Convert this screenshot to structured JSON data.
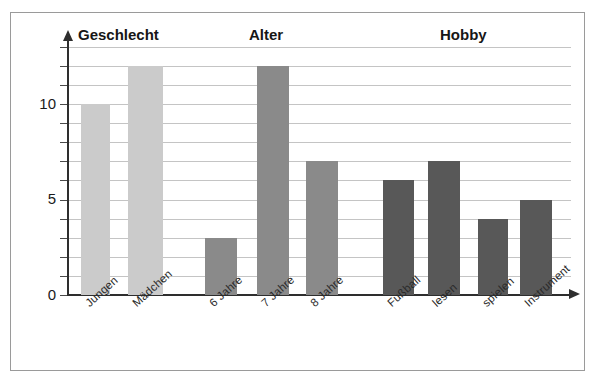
{
  "chart_data": {
    "type": "bar",
    "title": "",
    "xlabel": "",
    "ylabel": "",
    "ylim": [
      0,
      13
    ],
    "grid": true,
    "legend_position": "none",
    "y_ticks_labeled": [
      "0",
      "5",
      "10"
    ],
    "y_tick_values": [
      0,
      5,
      10
    ],
    "y_minor_ticks": [
      1,
      2,
      3,
      4,
      6,
      7,
      8,
      9,
      11,
      12,
      13
    ],
    "group_titles": [
      "Geschlecht",
      "Alter",
      "Hobby"
    ],
    "categories": [
      "Jungen",
      "Mädchen",
      "6 Jahre",
      "7 Jahre",
      "8 Jahre",
      "Fußball",
      "lesen",
      "spielen",
      "Instrument"
    ],
    "values": [
      10,
      12,
      3,
      12,
      7,
      6,
      7,
      4,
      5
    ],
    "groups": [
      {
        "name": "Geschlecht",
        "color": "#cbcbcb",
        "categories": [
          "Jungen",
          "Mädchen"
        ],
        "values": [
          10,
          12
        ]
      },
      {
        "name": "Alter",
        "color": "#8a8a8a",
        "categories": [
          "6 Jahre",
          "7 Jahre",
          "8 Jahre"
        ],
        "values": [
          3,
          12,
          7
        ]
      },
      {
        "name": "Hobby",
        "color": "#585858",
        "categories": [
          "Fußball",
          "lesen",
          "spielen",
          "Instrument"
        ],
        "values": [
          6,
          7,
          4,
          5
        ]
      }
    ]
  },
  "colors": {
    "group_geschlecht": "#cbcbcb",
    "group_alter": "#8a8a8a",
    "group_hobby": "#585858",
    "gridline": "#c4c4c4",
    "axis": "#2e2e2e",
    "frame_border": "#9a9a9a",
    "background": "#ffffff",
    "text": "#1a1a1a"
  },
  "axis": {
    "y_labels": [
      {
        "text": "0",
        "value": 0
      },
      {
        "text": "5",
        "value": 5
      },
      {
        "text": "10",
        "value": 10
      }
    ]
  }
}
